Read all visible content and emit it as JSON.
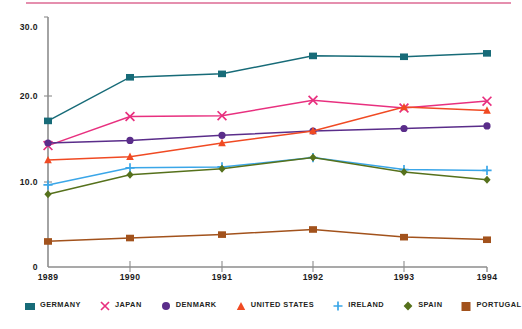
{
  "chart_data": {
    "type": "line",
    "title": "",
    "subtitle": "",
    "xlabel": "",
    "ylabel": "",
    "categories": [
      "1989",
      "1990",
      "1991",
      "1992",
      "1993",
      "1994"
    ],
    "x_tick_labels": [
      "1989",
      "1990",
      "1991",
      "1992",
      "1993",
      "1994"
    ],
    "y_tick_labels": [
      "0",
      "10.0",
      "20.0",
      "30.0"
    ],
    "y_ticks": [
      0,
      10,
      20,
      30
    ],
    "ylim": [
      0,
      30
    ],
    "grid": false,
    "legend_position": "bottom",
    "series": [
      {
        "name": "GERMANY",
        "color": "#176b78",
        "marker": "square",
        "values": [
          17.1,
          22.2,
          22.6,
          24.7,
          24.6,
          25.0
        ]
      },
      {
        "name": "JAPAN",
        "color": "#e8307f",
        "marker": "cross-x",
        "values": [
          14.2,
          17.6,
          17.7,
          19.5,
          18.6,
          19.4
        ]
      },
      {
        "name": "DENMARK",
        "color": "#5a2d8a",
        "marker": "circle",
        "values": [
          14.5,
          14.8,
          15.4,
          15.9,
          16.2,
          16.5
        ]
      },
      {
        "name": "UNITED STATES",
        "color": "#f04a23",
        "marker": "triangle",
        "values": [
          12.5,
          12.9,
          14.5,
          15.9,
          18.7,
          18.3
        ]
      },
      {
        "name": "IRELAND",
        "color": "#3aa6e8",
        "marker": "plus",
        "values": [
          9.6,
          11.6,
          11.7,
          12.8,
          11.4,
          11.3
        ]
      },
      {
        "name": "SPAIN",
        "color": "#56711c",
        "marker": "diamond",
        "values": [
          8.5,
          10.8,
          11.5,
          12.8,
          11.1,
          10.2
        ]
      },
      {
        "name": "PORTUGAL",
        "color": "#a2521c",
        "marker": "square",
        "values": [
          3.0,
          3.4,
          3.8,
          4.4,
          3.5,
          3.2
        ]
      }
    ]
  },
  "legend": {
    "items": [
      {
        "label": "GERMANY"
      },
      {
        "label": "JAPAN"
      },
      {
        "label": "DENMARK"
      },
      {
        "label": "UNITED STATES"
      },
      {
        "label": "IRELAND"
      },
      {
        "label": "SPAIN"
      },
      {
        "label": "PORTUGAL"
      }
    ]
  },
  "axes": {
    "y_labels": [
      "30.0",
      "20.0",
      "10.0",
      "0"
    ],
    "x_labels": [
      "1989",
      "1990",
      "1991",
      "1992",
      "1993",
      "1994"
    ]
  },
  "colors": {
    "axis": "#8d8d8d",
    "text": "#1b1b1b",
    "top_rule": "#e58fae"
  }
}
